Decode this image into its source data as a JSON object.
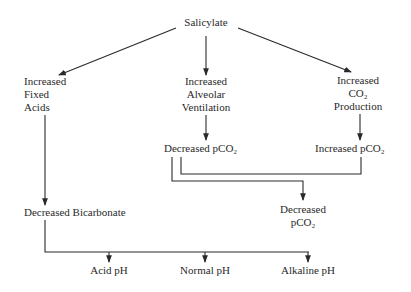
{
  "diagram": {
    "root": "Salicylate",
    "branches": {
      "left": [
        "Increased",
        "Fixed",
        "Acids"
      ],
      "middle": [
        "Increased",
        "Alveolar",
        "Ventilation"
      ],
      "right": [
        "Increased",
        "CO₂",
        "Production"
      ]
    },
    "middle_result": "Decreased pCO₂",
    "right_result": "Increased pCO₂",
    "left_result": "Decreased Bicarbonate",
    "combined_result": [
      "Decreased",
      "pCO₂"
    ],
    "outcomes": [
      "Acid pH",
      "Normal pH",
      "Alkaline pH"
    ]
  }
}
